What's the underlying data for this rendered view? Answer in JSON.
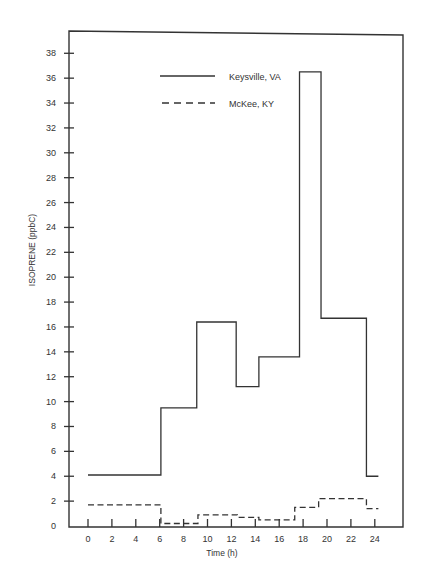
{
  "chart_data": {
    "type": "line",
    "subtype": "step",
    "title": "",
    "xlabel": "Time (h)",
    "ylabel": "ISOPRENE (ppbC)",
    "xlim": [
      -1.6,
      26.2
    ],
    "ylim": [
      0,
      39.5
    ],
    "x_ticks": [
      0,
      2,
      4,
      6,
      8,
      10,
      12,
      14,
      16,
      18,
      20,
      22,
      24
    ],
    "y_ticks": [
      0,
      2,
      4,
      6,
      8,
      10,
      12,
      14,
      16,
      18,
      20,
      22,
      24,
      26,
      28,
      30,
      32,
      34,
      36,
      38
    ],
    "grid": false,
    "legend_position": "upper-left-inside",
    "series": [
      {
        "name": "Keysville, VA",
        "style": "solid",
        "color": "#333333",
        "steps": [
          {
            "x_start": 0,
            "x_end": 6.1,
            "value": 4.1
          },
          {
            "x_start": 6.1,
            "x_end": 9.1,
            "value": 9.5
          },
          {
            "x_start": 9.1,
            "x_end": 12.4,
            "value": 16.4
          },
          {
            "x_start": 12.4,
            "x_end": 14.3,
            "value": 11.2
          },
          {
            "x_start": 14.3,
            "x_end": 17.7,
            "value": 13.6
          },
          {
            "x_start": 17.7,
            "x_end": 19.5,
            "value": 36.5
          },
          {
            "x_start": 19.5,
            "x_end": 23.3,
            "value": 16.7
          },
          {
            "x_start": 23.3,
            "x_end": 24.3,
            "value": 4.0
          }
        ]
      },
      {
        "name": "McKee, KY",
        "style": "dashed",
        "color": "#333333",
        "steps": [
          {
            "x_start": 0,
            "x_end": 6.1,
            "value": 1.7
          },
          {
            "x_start": 6.1,
            "x_end": 9.2,
            "value": 0.2
          },
          {
            "x_start": 9.2,
            "x_end": 12.5,
            "value": 0.9
          },
          {
            "x_start": 12.5,
            "x_end": 14.3,
            "value": 0.7
          },
          {
            "x_start": 14.3,
            "x_end": 17.3,
            "value": 0.5
          },
          {
            "x_start": 17.3,
            "x_end": 19.3,
            "value": 1.5
          },
          {
            "x_start": 19.3,
            "x_end": 23.3,
            "value": 2.2
          },
          {
            "x_start": 23.3,
            "x_end": 24.3,
            "value": 1.4
          }
        ]
      }
    ]
  },
  "legend": {
    "items": [
      {
        "label": "Keysville, VA",
        "style": "solid"
      },
      {
        "label": "McKee, KY",
        "style": "dashed"
      }
    ]
  }
}
